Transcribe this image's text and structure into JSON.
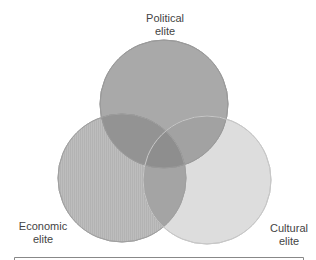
{
  "diagram": {
    "type": "venn",
    "sets": [
      {
        "id": "political",
        "line1": "Political",
        "line2": "elite",
        "fill": "#a6a6a6"
      },
      {
        "id": "economic",
        "line1": "Economic",
        "line2": "elite",
        "fill": "#bcbcbc"
      },
      {
        "id": "cultural",
        "line1": "Cultural",
        "line2": "elite",
        "fill": "#dcdcdc"
      }
    ],
    "stroke_color": "#9a9a9a",
    "frame_color": "#888888"
  }
}
